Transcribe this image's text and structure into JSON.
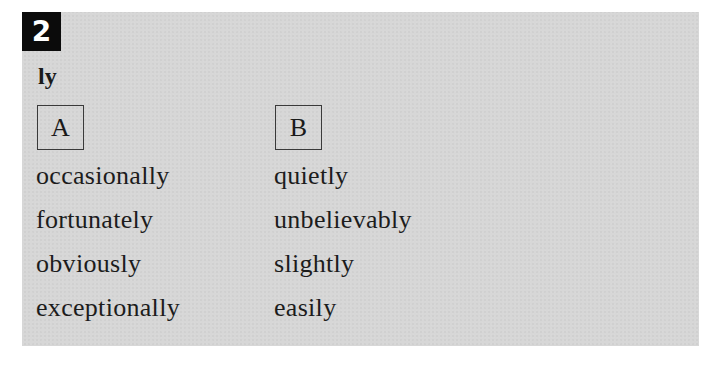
{
  "exercise": {
    "number": "2",
    "suffix_label": "ly",
    "columns": [
      {
        "header": "A",
        "words": [
          "occasionally",
          "fortunately",
          "obviously",
          "exceptionally"
        ]
      },
      {
        "header": "B",
        "words": [
          "quietly",
          "unbelievably",
          "slightly",
          "easily"
        ]
      }
    ]
  },
  "colors": {
    "panel_background": "#d7d7d7",
    "badge_background": "#0b0b0b",
    "badge_text": "#ffffff",
    "text": "#1c1c1c"
  }
}
